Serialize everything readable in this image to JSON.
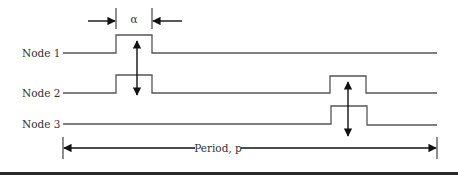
{
  "diagram": {
    "type": "timing-diagram",
    "width_label": "α",
    "period_label": "Period, p",
    "nodes": [
      {
        "label": "Node 1",
        "pulses": [
          "first slot (width α)"
        ]
      },
      {
        "label": "Node 2",
        "pulses": [
          "first slot (width α)",
          "later slot"
        ]
      },
      {
        "label": "Node 3",
        "pulses": [
          "later slot"
        ]
      }
    ],
    "colors": {
      "signal_line": "#555555",
      "arrow": "#111111",
      "text": "#333333",
      "bottom_rule": "#2a2a2a"
    }
  }
}
